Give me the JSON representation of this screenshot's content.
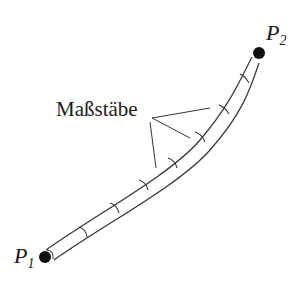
{
  "diagram": {
    "title": "",
    "points": [
      {
        "id": "P1",
        "letter": "P",
        "subscript": "1"
      },
      {
        "id": "P2",
        "letter": "P",
        "subscript": "2"
      }
    ],
    "annotation": {
      "text": "Maßstäbe"
    },
    "colors": {
      "stroke": "#333333",
      "dot": "#111111",
      "background": "#ffffff"
    },
    "segment_count": 8
  }
}
